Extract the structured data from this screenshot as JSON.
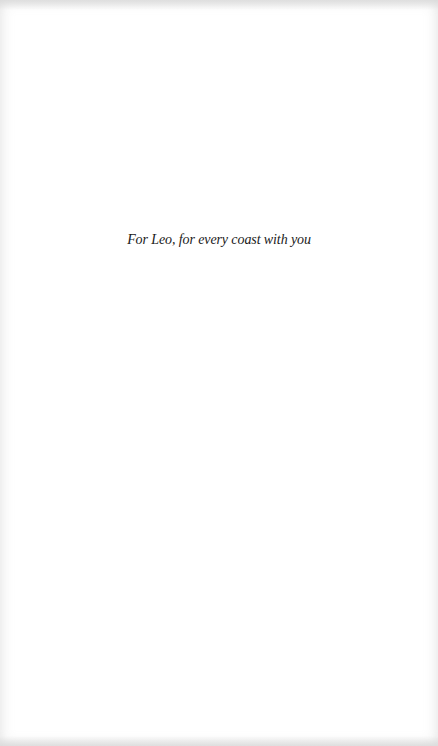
{
  "page": {
    "dedication": "For Leo, for every coast with you"
  },
  "colors": {
    "background": "#ffffff",
    "text": "#1a1a1a"
  }
}
